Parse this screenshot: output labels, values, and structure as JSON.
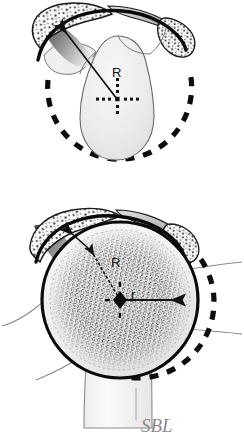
{
  "figure": {
    "signature": "SBL",
    "background_color": "#ffffff",
    "ink_color": "#111111",
    "bone_fill": "#f2f2f2",
    "head_fill": "#e9e9e9",
    "shadow_color": "#4a4a4a",
    "stipple_color": "#1a1a1a",
    "signature_color": "#8a8a8a",
    "panels": [
      {
        "id": "panel-top",
        "name": "scapula-glenoid-view",
        "caption": "",
        "parts": [
          {
            "name": "acromion",
            "label": ""
          },
          {
            "name": "coracoid-process",
            "label": ""
          },
          {
            "name": "glenoid-fossa",
            "label": ""
          },
          {
            "name": "scapula-body",
            "label": ""
          }
        ],
        "annotations": [
          {
            "name": "radius-label-R",
            "text": "R",
            "x": 118,
            "y": 72
          },
          {
            "name": "center-marker",
            "text": "",
            "x": 117,
            "y": 99
          },
          {
            "name": "dashed-rotation-circle",
            "text": ""
          }
        ]
      },
      {
        "id": "panel-bottom",
        "name": "humeral-head-view",
        "caption": "",
        "parts": [
          {
            "name": "acromion",
            "label": ""
          },
          {
            "name": "coracoid-process",
            "label": ""
          },
          {
            "name": "humeral-head",
            "label": ""
          },
          {
            "name": "humeral-shaft",
            "label": ""
          }
        ],
        "annotations": [
          {
            "name": "radius-label-R",
            "text": "R",
            "x": 117,
            "y": 262
          },
          {
            "name": "radius-label-r",
            "text": "r",
            "x": 134,
            "y": 295
          },
          {
            "name": "center-marker",
            "text": "",
            "x": 120,
            "y": 300
          },
          {
            "name": "dashed-rotation-circle",
            "text": ""
          }
        ]
      }
    ],
    "labels": {
      "radius_major": "R",
      "radius_minor": "r"
    }
  }
}
